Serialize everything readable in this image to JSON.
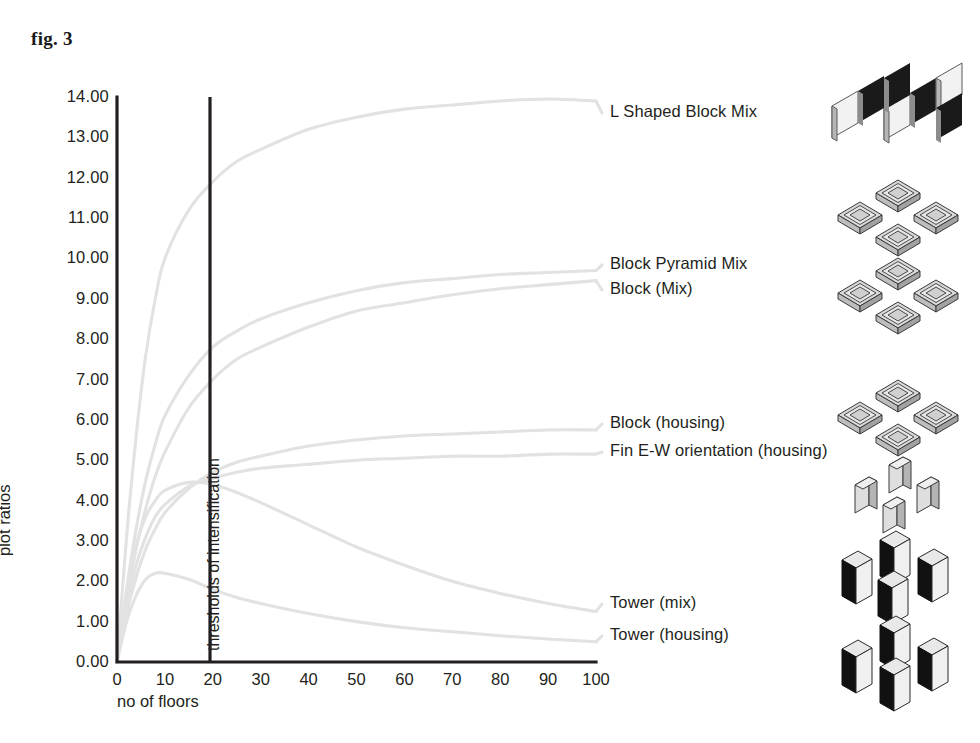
{
  "figure": {
    "caption": "fig. 3"
  },
  "chart_data": {
    "type": "line",
    "title": "fig. 3",
    "xlabel": "no of floors",
    "ylabel": "plot ratios",
    "xlim": [
      0,
      100
    ],
    "ylim": [
      0,
      14
    ],
    "grid": false,
    "legend_position": "right-inline",
    "x_ticks": [
      "0",
      "10",
      "20",
      "30",
      "40",
      "50",
      "60",
      "70",
      "80",
      "90",
      "100"
    ],
    "y_ticks": [
      "0.00",
      "1.00",
      "2.00",
      "3.00",
      "4.00",
      "5.00",
      "6.00",
      "7.00",
      "8.00",
      "9.00",
      "10.00",
      "11.00",
      "12.00",
      "13.00",
      "14.00"
    ],
    "annotations": [
      {
        "name": "thresholds-of-intensification",
        "text": "thresholds of intensification",
        "x": 20,
        "orientation": "vertical-line"
      }
    ],
    "x": [
      0,
      2,
      4,
      6,
      8,
      10,
      15,
      20,
      25,
      30,
      40,
      50,
      60,
      70,
      80,
      90,
      100
    ],
    "series": [
      {
        "name": "L Shaped Block Mix",
        "label": "L Shaped Block Mix",
        "values": [
          0.0,
          3.1,
          5.6,
          7.6,
          9.0,
          10.0,
          11.2,
          11.9,
          12.4,
          12.7,
          13.2,
          13.5,
          13.7,
          13.8,
          13.9,
          13.95,
          13.9
        ]
      },
      {
        "name": "Block Pyramid Mix",
        "label": "Block Pyramid Mix",
        "values": [
          0.0,
          1.8,
          3.3,
          4.5,
          5.4,
          6.1,
          7.1,
          7.8,
          8.2,
          8.5,
          8.9,
          9.2,
          9.4,
          9.5,
          9.6,
          9.65,
          9.7
        ]
      },
      {
        "name": "Block (Mix)",
        "label": "Block (Mix)",
        "values": [
          0.0,
          1.5,
          2.8,
          3.8,
          4.6,
          5.2,
          6.3,
          7.0,
          7.5,
          7.8,
          8.3,
          8.7,
          8.9,
          9.1,
          9.25,
          9.35,
          9.45
        ]
      },
      {
        "name": "Block (housing)",
        "label": "Block (housing)",
        "values": [
          0.0,
          1.2,
          2.1,
          2.8,
          3.3,
          3.7,
          4.3,
          4.7,
          4.95,
          5.1,
          5.35,
          5.5,
          5.6,
          5.65,
          5.7,
          5.75,
          5.75
        ]
      },
      {
        "name": "Fin E-W orientation (housing)",
        "label": "Fin E-W orientation (housing)",
        "values": [
          0.0,
          1.4,
          2.4,
          3.1,
          3.6,
          3.9,
          4.35,
          4.55,
          4.7,
          4.8,
          4.9,
          5.0,
          5.05,
          5.1,
          5.1,
          5.15,
          5.15
        ]
      },
      {
        "name": "Tower (mix)",
        "label": "Tower (mix)",
        "values": [
          0.0,
          1.7,
          2.9,
          3.6,
          4.0,
          4.25,
          4.45,
          4.4,
          4.2,
          3.95,
          3.4,
          2.85,
          2.4,
          2.0,
          1.7,
          1.45,
          1.25
        ]
      },
      {
        "name": "Tower (housing)",
        "label": "Tower (housing)",
        "values": [
          0.0,
          1.0,
          1.65,
          2.05,
          2.2,
          2.2,
          2.05,
          1.8,
          1.6,
          1.45,
          1.2,
          1.0,
          0.85,
          0.75,
          0.65,
          0.57,
          0.5
        ]
      }
    ]
  },
  "icons": [
    {
      "name": "l-shaped-block-mix-icon",
      "alt": "L shaped block massing diagram"
    },
    {
      "name": "block-pyramid-mix-icon",
      "alt": "Block pyramid massing diagram"
    },
    {
      "name": "block-mix-icon",
      "alt": "Block mix massing diagram"
    },
    {
      "name": "block-housing-icon",
      "alt": "Block housing massing diagram"
    },
    {
      "name": "fin-ew-orientation-icon",
      "alt": "Fin East-West orientation massing diagram"
    },
    {
      "name": "tower-mix-icon",
      "alt": "Tower mix massing diagram"
    },
    {
      "name": "tower-housing-icon",
      "alt": "Tower housing massing diagram"
    }
  ]
}
